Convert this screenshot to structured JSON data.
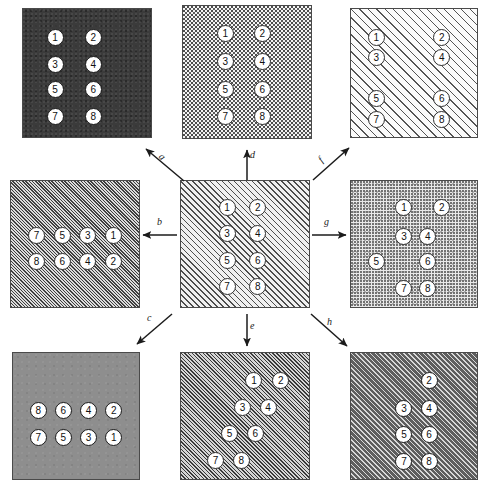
{
  "figure": {
    "node_labels": [
      "1",
      "2",
      "3",
      "4",
      "5",
      "6",
      "7",
      "8"
    ]
  },
  "panels": [
    {
      "id": "top-left",
      "name": "panel-top-left",
      "fill": "dark-noise",
      "fill_color": "#3b3b3b",
      "nodes": [
        {
          "label": "1",
          "x": 25,
          "y": 22
        },
        {
          "label": "2",
          "x": 55,
          "y": 22
        },
        {
          "label": "3",
          "x": 25,
          "y": 43
        },
        {
          "label": "4",
          "x": 55,
          "y": 43
        },
        {
          "label": "5",
          "x": 25,
          "y": 63
        },
        {
          "label": "6",
          "x": 55,
          "y": 63
        },
        {
          "label": "7",
          "x": 25,
          "y": 84
        },
        {
          "label": "8",
          "x": 55,
          "y": 84
        }
      ]
    },
    {
      "id": "top-middle",
      "name": "panel-top-middle",
      "fill": "dither-light",
      "fill_color": "#f4f4f4",
      "nodes": [
        {
          "label": "1",
          "x": 33,
          "y": 21
        },
        {
          "label": "2",
          "x": 62,
          "y": 21
        },
        {
          "label": "3",
          "x": 33,
          "y": 42
        },
        {
          "label": "4",
          "x": 62,
          "y": 42
        },
        {
          "label": "5",
          "x": 33,
          "y": 63
        },
        {
          "label": "6",
          "x": 62,
          "y": 63
        },
        {
          "label": "7",
          "x": 33,
          "y": 84
        },
        {
          "label": "8",
          "x": 62,
          "y": 84
        }
      ]
    },
    {
      "id": "top-right",
      "name": "panel-top-right",
      "fill": "hatch-light",
      "fill_color": "#fbfbfb",
      "nodes": [
        {
          "label": "1",
          "x": 20,
          "y": 22
        },
        {
          "label": "2",
          "x": 72,
          "y": 22
        },
        {
          "label": "3",
          "x": 20,
          "y": 38
        },
        {
          "label": "4",
          "x": 72,
          "y": 38
        },
        {
          "label": "5",
          "x": 20,
          "y": 70
        },
        {
          "label": "6",
          "x": 72,
          "y": 70
        },
        {
          "label": "7",
          "x": 20,
          "y": 86
        },
        {
          "label": "8",
          "x": 72,
          "y": 86
        }
      ]
    },
    {
      "id": "middle-left",
      "name": "panel-middle-left",
      "fill": "hatch-tight-left",
      "fill_color": "#dcdcdc",
      "nodes": [
        {
          "label": "7",
          "x": 20,
          "y": 43
        },
        {
          "label": "5",
          "x": 40,
          "y": 43
        },
        {
          "label": "3",
          "x": 60,
          "y": 43
        },
        {
          "label": "1",
          "x": 80,
          "y": 43
        },
        {
          "label": "8",
          "x": 20,
          "y": 64
        },
        {
          "label": "6",
          "x": 40,
          "y": 64
        },
        {
          "label": "4",
          "x": 60,
          "y": 64
        },
        {
          "label": "2",
          "x": 80,
          "y": 64
        }
      ]
    },
    {
      "id": "center",
      "name": "panel-center-reference",
      "fill": "hatch-mid",
      "fill_color": "#f0f0f0",
      "nodes": [
        {
          "label": "1",
          "x": 36,
          "y": 21
        },
        {
          "label": "2",
          "x": 60,
          "y": 21
        },
        {
          "label": "3",
          "x": 36,
          "y": 42
        },
        {
          "label": "4",
          "x": 60,
          "y": 42
        },
        {
          "label": "5",
          "x": 36,
          "y": 63
        },
        {
          "label": "6",
          "x": 60,
          "y": 63
        },
        {
          "label": "7",
          "x": 36,
          "y": 84
        },
        {
          "label": "8",
          "x": 60,
          "y": 84
        }
      ]
    },
    {
      "id": "middle-right",
      "name": "panel-middle-right",
      "fill": "dither-fine",
      "fill_color": "#e9e9e9",
      "nodes": [
        {
          "label": "1",
          "x": 42,
          "y": 21
        },
        {
          "label": "2",
          "x": 72,
          "y": 21
        },
        {
          "label": "3",
          "x": 42,
          "y": 44
        },
        {
          "label": "4",
          "x": 61,
          "y": 44
        },
        {
          "label": "5",
          "x": 20,
          "y": 64
        },
        {
          "label": "6",
          "x": 61,
          "y": 64
        },
        {
          "label": "7",
          "x": 42,
          "y": 85
        },
        {
          "label": "8",
          "x": 61,
          "y": 85
        }
      ]
    },
    {
      "id": "bottom-left",
      "name": "panel-bottom-left",
      "fill": "solid-gray",
      "fill_color": "#8e8e8e",
      "nodes": [
        {
          "label": "8",
          "x": 20,
          "y": 46
        },
        {
          "label": "6",
          "x": 40,
          "y": 46
        },
        {
          "label": "4",
          "x": 60,
          "y": 46
        },
        {
          "label": "2",
          "x": 80,
          "y": 46
        },
        {
          "label": "7",
          "x": 20,
          "y": 67
        },
        {
          "label": "5",
          "x": 40,
          "y": 67
        },
        {
          "label": "3",
          "x": 60,
          "y": 67
        },
        {
          "label": "1",
          "x": 80,
          "y": 67
        }
      ]
    },
    {
      "id": "bottom-middle",
      "name": "panel-bottom-middle",
      "fill": "hatch-mid-dense",
      "fill_color": "#d6d6d6",
      "nodes": [
        {
          "label": "1",
          "x": 57,
          "y": 22
        },
        {
          "label": "2",
          "x": 78,
          "y": 22
        },
        {
          "label": "3",
          "x": 48,
          "y": 43
        },
        {
          "label": "4",
          "x": 68,
          "y": 43
        },
        {
          "label": "5",
          "x": 38,
          "y": 64
        },
        {
          "label": "6",
          "x": 58,
          "y": 64
        },
        {
          "label": "7",
          "x": 27,
          "y": 85
        },
        {
          "label": "8",
          "x": 47,
          "y": 85
        }
      ]
    },
    {
      "id": "bottom-right",
      "name": "panel-bottom-right",
      "fill": "hatch-dark",
      "fill_color": "#5e5e5e",
      "nodes": [
        {
          "label": "2",
          "x": 62,
          "y": 22
        },
        {
          "label": "3",
          "x": 42,
          "y": 44
        },
        {
          "label": "4",
          "x": 62,
          "y": 44
        },
        {
          "label": "5",
          "x": 42,
          "y": 65
        },
        {
          "label": "6",
          "x": 62,
          "y": 65
        },
        {
          "label": "7",
          "x": 42,
          "y": 86
        },
        {
          "label": "8",
          "x": 62,
          "y": 86
        }
      ]
    }
  ],
  "arrows": [
    {
      "id": "a",
      "label": "a",
      "name": "arrow-a",
      "direction": "up-left"
    },
    {
      "id": "b",
      "label": "b",
      "name": "arrow-b",
      "direction": "left"
    },
    {
      "id": "c",
      "label": "c",
      "name": "arrow-c",
      "direction": "down-left"
    },
    {
      "id": "d",
      "label": "d",
      "name": "arrow-d",
      "direction": "up"
    },
    {
      "id": "e",
      "label": "e",
      "name": "arrow-e",
      "direction": "down"
    },
    {
      "id": "f",
      "label": "f",
      "name": "arrow-f",
      "direction": "up-right"
    },
    {
      "id": "g",
      "label": "g",
      "name": "arrow-g",
      "direction": "right"
    },
    {
      "id": "h",
      "label": "h",
      "name": "arrow-h",
      "direction": "down-right"
    }
  ]
}
